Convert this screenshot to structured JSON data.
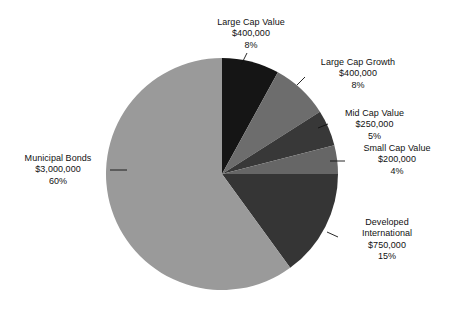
{
  "chart_data": {
    "type": "pie",
    "title": "",
    "subtitle": "",
    "xlabel": "",
    "ylabel": "",
    "legend_position": "none",
    "grid": false,
    "total_value": 5000000,
    "categories": [
      "Large Cap Value",
      "Large Cap Growth",
      "Mid Cap Value",
      "Small Cap Value",
      "Developed International",
      "Municipal Bonds"
    ],
    "values": [
      400000,
      400000,
      250000,
      200000,
      750000,
      3000000
    ],
    "percents": [
      8,
      8,
      5,
      4,
      15,
      60
    ],
    "colors": [
      "#151515",
      "#6d6d6d",
      "#383838",
      "#666666",
      "#353535",
      "#9a9a9a"
    ],
    "start_angle_deg": 0,
    "direction": "clockwise",
    "slices": [
      {
        "name": "Large Cap Value",
        "value": 400000,
        "value_label": "$400,000",
        "percent": 8,
        "percent_label": "8%",
        "color": "#151515"
      },
      {
        "name": "Large Cap Growth",
        "value": 400000,
        "value_label": "$400,000",
        "percent": 8,
        "percent_label": "8%",
        "color": "#6d6d6d"
      },
      {
        "name": "Mid Cap Value",
        "value": 250000,
        "value_label": "$250,000",
        "percent": 5,
        "percent_label": "5%",
        "color": "#383838"
      },
      {
        "name": "Small Cap Value",
        "value": 200000,
        "value_label": "$200,000",
        "percent": 4,
        "percent_label": "4%",
        "color": "#666666"
      },
      {
        "name": "Developed International",
        "value": 750000,
        "value_label": "$750,000",
        "percent": 15,
        "percent_label": "15%",
        "color": "#353535"
      },
      {
        "name": "Municipal Bonds",
        "value": 3000000,
        "value_label": "$3,000,000",
        "percent": 60,
        "percent_label": "60%",
        "color": "#9a9a9a"
      }
    ]
  },
  "labels": {
    "large_cap_value": {
      "name": "Large Cap Value",
      "value": "$400,000",
      "percent": "8%"
    },
    "large_cap_growth": {
      "name": "Large Cap Growth",
      "value": "$400,000",
      "percent": "8%"
    },
    "mid_cap_value": {
      "name": "Mid Cap Value",
      "value": "$250,000",
      "percent": "5%"
    },
    "small_cap_value": {
      "name": "Small Cap Value",
      "value": "$200,000",
      "percent": "4%"
    },
    "developed_international": {
      "name_line1": "Developed",
      "name_line2": "International",
      "value": "$750,000",
      "percent": "15%"
    },
    "municipal_bonds": {
      "name": "Municipal Bonds",
      "value": "$3,000,000",
      "percent": "60%"
    }
  }
}
